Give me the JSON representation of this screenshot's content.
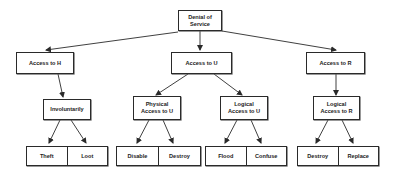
{
  "diagram": {
    "type": "attack-tree",
    "root": {
      "label": "Denial of\nService"
    },
    "level1": [
      {
        "id": "access-h",
        "label": "Access to H"
      },
      {
        "id": "access-u",
        "label": "Access to U"
      },
      {
        "id": "access-r",
        "label": "Access to R"
      }
    ],
    "level2": [
      {
        "id": "involuntarily",
        "label": "Involuntarily",
        "parent": "access-h"
      },
      {
        "id": "physical-u",
        "label": "Physical\nAccess to U",
        "parent": "access-u"
      },
      {
        "id": "logical-u",
        "label": "Logical\nAccess to U",
        "parent": "access-u"
      },
      {
        "id": "logical-r",
        "label": "Logical\nAccess to R",
        "parent": "access-r"
      }
    ],
    "leaves": [
      {
        "parent": "involuntarily",
        "items": [
          "Theft",
          "Loot"
        ]
      },
      {
        "parent": "physical-u",
        "items": [
          "Disable",
          "Destroy"
        ]
      },
      {
        "parent": "logical-u",
        "items": [
          "Flood",
          "Confuse"
        ]
      },
      {
        "parent": "logical-r",
        "items": [
          "Destroy",
          "Replace"
        ]
      }
    ],
    "colors": {
      "stroke": "#2a2a2a",
      "background": "#ffffff",
      "text": "#222222"
    }
  }
}
